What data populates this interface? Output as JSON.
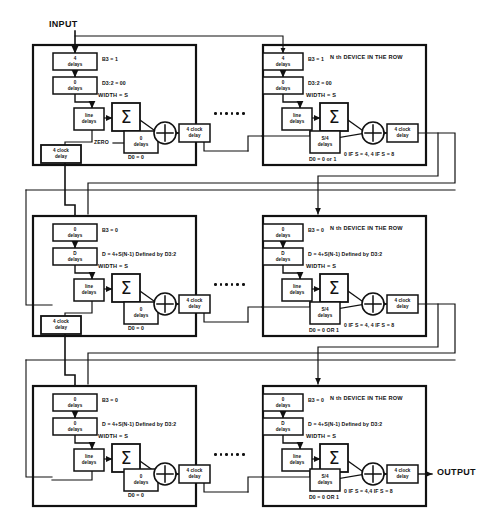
{
  "diagram": {
    "io": {
      "input_label": "INPUT",
      "output_label": "OUTPUT"
    },
    "ellipsis_dots": 6,
    "colors": {
      "line": "#111111",
      "fill": "#ffffff",
      "text": "#111111"
    },
    "rows": [
      {
        "id": "row-1",
        "left_device": {
          "name": "first-device-row-1",
          "blocks": {
            "top_delay": "4\ndelays",
            "second_delay": "0\ndelays",
            "line_delays": "line\ndelays",
            "sum": "Σ",
            "lower_delay": "0\ndelays",
            "adder": "+",
            "clock_delay": "4 clock\ndelay",
            "feedback_clock_delay": "4 clock\ndelay"
          },
          "annotations": {
            "top_delay_note": "B3 = 1",
            "second_delay_note": "D3:2 = 00",
            "width_note": "WIDTH = S",
            "zero_note": "ZERO",
            "lower_delay_note": "D0 = 0"
          }
        },
        "right_device": {
          "name": "nth-device-row-1",
          "blocks": {
            "top_delay": "4\ndelays",
            "second_delay": "0\ndelays",
            "line_delays": "line\ndelays",
            "sum": "Σ",
            "lower_delay": "S/4\ndelays",
            "adder": "+",
            "clock_delay": "4 clock\ndelay"
          },
          "annotations": {
            "heading": "N th DEVICE IN THE ROW",
            "top_delay_note": "B3 = 1",
            "second_delay_note": "D3:2 = 00",
            "width_note": "WIDTH = S",
            "sum_condition": "0 IF S = 4, 4 IF S = 8",
            "lower_delay_note": "D0 = 0 or 1"
          }
        }
      },
      {
        "id": "row-2",
        "left_device": {
          "name": "first-device-row-2",
          "blocks": {
            "top_delay": "0\ndelays",
            "second_delay": "D\ndelays",
            "line_delays": "line\ndelays",
            "sum": "Σ",
            "lower_delay": "0\ndelays",
            "adder": "+",
            "clock_delay": "4 clock\ndelay",
            "feedback_clock_delay": "4 clock\ndelay"
          },
          "annotations": {
            "top_delay_note": "B3 = 0",
            "second_delay_note": "D = 4+S(N-1) Defined by D3:2",
            "width_note": "WIDTH = S",
            "lower_delay_note": "D0 = 0"
          }
        },
        "right_device": {
          "name": "nth-device-row-2",
          "blocks": {
            "top_delay": "0\ndelays",
            "second_delay": "D\ndelays",
            "line_delays": "line\ndelays",
            "sum": "Σ",
            "lower_delay": "S/4\ndelays",
            "adder": "+",
            "clock_delay": "4 clock\ndelay"
          },
          "annotations": {
            "heading": "N th DEVICE IN THE ROW",
            "top_delay_note": "B3 = 0",
            "second_delay_note": "D = 4+S(N-1) Defined by D3:2",
            "width_note": "WIDTH = S",
            "sum_condition": "0 IF S = 4, 4 IF S = 8",
            "lower_delay_note": "D0 = 0 OR 1"
          }
        }
      },
      {
        "id": "row-3",
        "left_device": {
          "name": "first-device-row-3",
          "blocks": {
            "top_delay": "0\ndelays",
            "second_delay": "0\ndelays",
            "line_delays": "line\ndelays",
            "sum": "Σ",
            "lower_delay": "0\ndelays",
            "adder": "+",
            "clock_delay": "4 clock\ndelay"
          },
          "annotations": {
            "top_delay_note": "B3 = 0",
            "second_delay_note": "D = 4+S(N-1) Defined by D3:2",
            "width_note": "WIDTH = S",
            "lower_delay_note": "D0 = 0"
          }
        },
        "right_device": {
          "name": "nth-device-row-3",
          "blocks": {
            "top_delay": "0\ndelays",
            "second_delay": "D\ndelays",
            "line_delays": "line\ndelays",
            "sum": "Σ",
            "lower_delay": "S/4\ndelays",
            "adder": "+",
            "clock_delay": "4 clock\ndelay"
          },
          "annotations": {
            "heading": "N th DEVICE IN THE ROW",
            "top_delay_note": "B3 = 0",
            "second_delay_note": "D = 4+S(N-1) Defined by D3:2",
            "width_note": "WIDTH = S",
            "sum_condition": "0 IF S = 4,4 IF S = 8",
            "lower_delay_note": "D0 = 0 OR 1"
          }
        }
      }
    ]
  }
}
